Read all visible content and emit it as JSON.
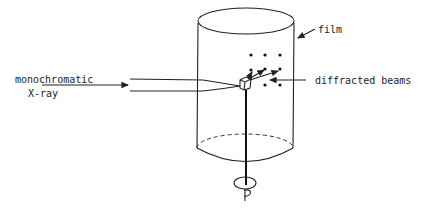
{
  "diagram": {
    "type": "Laue / rotating-crystal X-ray diffraction setup",
    "labels": {
      "source_line1": "monochromatic",
      "source_line2": "X-ray",
      "film": "film",
      "beams": "diffracted beams"
    },
    "colors": {
      "ink": "#222222",
      "background": "#ffffff"
    },
    "components": [
      "incident-beam",
      "crystal",
      "cylindrical-film",
      "rotation-rod",
      "rotation-indicator"
    ],
    "spot_count": 8
  }
}
